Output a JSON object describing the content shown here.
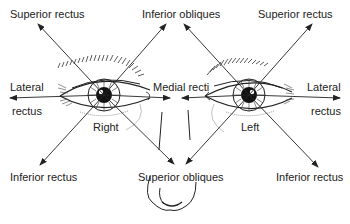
{
  "diagram": {
    "eyes": {
      "right": {
        "label": "Right"
      },
      "left": {
        "label": "Left"
      }
    },
    "labels": {
      "superior_rectus_right": "Superior rectus",
      "inferior_obliques": "Inferior obliques",
      "superior_rectus_left": "Superior rectus",
      "lateral_right_line1": "Lateral",
      "lateral_right_line2": "rectus",
      "medial_recti": "Medial recti",
      "lateral_left_line1": "Lateral",
      "lateral_left_line2": "rectus",
      "inferior_rectus_right": "Inferior rectus",
      "superior_obliques": "Superior obliques",
      "inferior_rectus_left": "Inferior rectus"
    },
    "colors": {
      "line": "#222222",
      "background": "#ffffff"
    }
  }
}
